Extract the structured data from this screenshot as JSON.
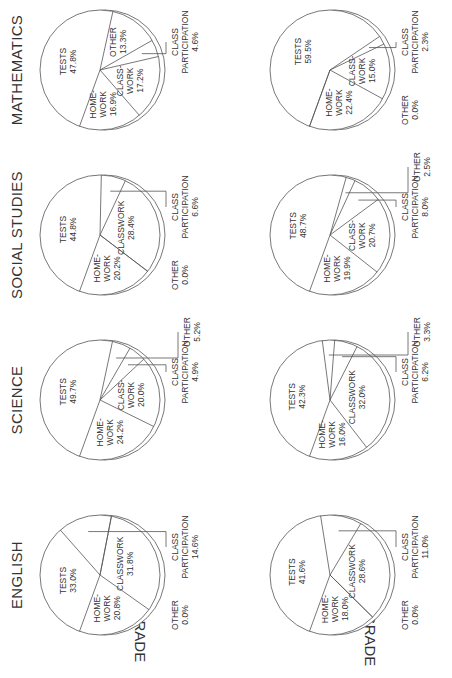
{
  "chart_data": {
    "type": "pie",
    "title": "",
    "rows": [
      "7th GRADE",
      "10th GRADE"
    ],
    "columns": [
      "ENGLISH",
      "SCIENCE",
      "SOCIAL STUDIES",
      "MATHEMATICS"
    ],
    "charts": [
      {
        "grade": "7th GRADE",
        "subject": "ENGLISH",
        "slices": [
          {
            "name": "TESTS",
            "label": [
              "TESTS"
            ],
            "value": 33.0
          },
          {
            "name": "CLASS PARTICIPATION",
            "label": [
              "CLASS",
              "PARTICIPATION"
            ],
            "value": 14.6,
            "external": true
          },
          {
            "name": "OTHER",
            "label": [
              "OTHER"
            ],
            "value": 0.0,
            "external": true
          },
          {
            "name": "CLASSWORK",
            "label": [
              "CLASSWORK"
            ],
            "value": 31.8
          },
          {
            "name": "HOMEWORK",
            "label": [
              "HOME-",
              "WORK"
            ],
            "value": 20.8
          }
        ]
      },
      {
        "grade": "7th GRADE",
        "subject": "SCIENCE",
        "slices": [
          {
            "name": "TESTS",
            "label": [
              "TESTS"
            ],
            "value": 49.7
          },
          {
            "name": "OTHER",
            "label": [
              "OTHER"
            ],
            "value": 5.2,
            "external": true
          },
          {
            "name": "CLASS PARTICIPATION",
            "label": [
              "CLASS",
              "PARTICIPATION"
            ],
            "value": 4.9,
            "external": true
          },
          {
            "name": "CLASSWORK",
            "label": [
              "CLASS-",
              "WORK"
            ],
            "value": 20.0
          },
          {
            "name": "HOMEWORK",
            "label": [
              "HOME-",
              "WORK"
            ],
            "value": 24.2
          }
        ]
      },
      {
        "grade": "7th GRADE",
        "subject": "SOCIAL STUDIES",
        "slices": [
          {
            "name": "TESTS",
            "label": [
              "TESTS"
            ],
            "value": 44.8
          },
          {
            "name": "CLASS PARTICIPATION",
            "label": [
              "CLASS",
              "PARTICIPATION"
            ],
            "value": 6.6,
            "external": true
          },
          {
            "name": "CLASSWORK",
            "label": [
              "CLASSWORK"
            ],
            "value": 28.4
          },
          {
            "name": "OTHER",
            "label": [
              "OTHER"
            ],
            "value": 0.0,
            "external": true
          },
          {
            "name": "HOMEWORK",
            "label": [
              "HOME-",
              "WORK"
            ],
            "value": 20.2
          }
        ]
      },
      {
        "grade": "7th GRADE",
        "subject": "MATHEMATICS",
        "slices": [
          {
            "name": "TESTS",
            "label": [
              "TESTS"
            ],
            "value": 47.8
          },
          {
            "name": "OTHER",
            "label": [
              "OTHER"
            ],
            "value": 13.3
          },
          {
            "name": "CLASS PARTICIPATION",
            "label": [
              "CLASS",
              "PARTICIPATION"
            ],
            "value": 4.6,
            "external": true
          },
          {
            "name": "CLASSWORK",
            "label": [
              "CLASS-",
              "WORK"
            ],
            "value": 17.2
          },
          {
            "name": "HOMEWORK",
            "label": [
              "HOME-",
              "WORK"
            ],
            "value": 16.9
          }
        ]
      },
      {
        "grade": "10th GRADE",
        "subject": "ENGLISH",
        "slices": [
          {
            "name": "TESTS",
            "label": [
              "TESTS"
            ],
            "value": 41.6
          },
          {
            "name": "CLASS PARTICIPATION",
            "label": [
              "CLASS",
              "PARTICIPATION"
            ],
            "value": 11.0,
            "external": true
          },
          {
            "name": "CLASSWORK",
            "label": [
              "CLASSWORK"
            ],
            "value": 28.6
          },
          {
            "name": "OTHER",
            "label": [
              "OTHER"
            ],
            "value": 0.0,
            "external": true
          },
          {
            "name": "HOMEWORK",
            "label": [
              "HOME-",
              "WORK"
            ],
            "value": 18.0
          }
        ]
      },
      {
        "grade": "10th GRADE",
        "subject": "SCIENCE",
        "slices": [
          {
            "name": "TESTS",
            "label": [
              "TESTS"
            ],
            "value": 42.3
          },
          {
            "name": "OTHER",
            "label": [
              "OTHER"
            ],
            "value": 3.3,
            "external": true
          },
          {
            "name": "CLASS PARTICIPATION",
            "label": [
              "CLASS",
              "PARTICIPATION"
            ],
            "value": 6.2,
            "external": true
          },
          {
            "name": "CLASSWORK",
            "label": [
              "CLASSWORK"
            ],
            "value": 32.0
          },
          {
            "name": "HOMEWORK",
            "label": [
              "HOME-",
              "WORK"
            ],
            "value": 16.0
          }
        ]
      },
      {
        "grade": "10th GRADE",
        "subject": "SOCIAL STUDIES",
        "slices": [
          {
            "name": "TESTS",
            "label": [
              "TESTS"
            ],
            "value": 48.7
          },
          {
            "name": "OTHER",
            "label": [
              "OTHER"
            ],
            "value": 2.5,
            "external": true
          },
          {
            "name": "CLASS PARTICIPATION",
            "label": [
              "CLASS",
              "PARTICIPATION"
            ],
            "value": 8.0,
            "external": true
          },
          {
            "name": "CLASSWORK",
            "label": [
              "CLASS-",
              "WORK"
            ],
            "value": 20.7
          },
          {
            "name": "HOMEWORK",
            "label": [
              "HOME-",
              "WORK"
            ],
            "value": 19.9
          }
        ]
      },
      {
        "grade": "10th GRADE",
        "subject": "MATHEMATICS",
        "slices": [
          {
            "name": "TESTS",
            "label": [
              "TESTS"
            ],
            "value": 59.5
          },
          {
            "name": "CLASS PARTICIPATION",
            "label": [
              "CLASS",
              "PARTICIPATION"
            ],
            "value": 2.3,
            "external": true
          },
          {
            "name": "CLASSWORK",
            "label": [
              "CLASS-",
              "WORK"
            ],
            "value": 15.0
          },
          {
            "name": "HOMEWORK",
            "label": [
              "HOME-",
              "WORK"
            ],
            "value": 22.4
          },
          {
            "name": "OTHER",
            "label": [
              "OTHER"
            ],
            "value": 0.0,
            "external": true
          }
        ]
      }
    ]
  }
}
